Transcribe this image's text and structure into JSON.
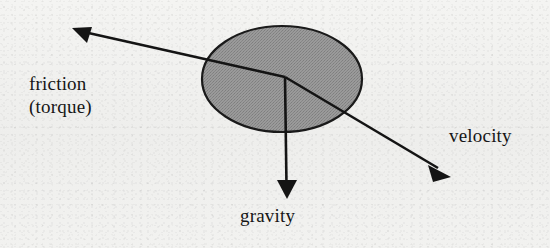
{
  "figure": {
    "width": 550,
    "height": 248,
    "background_color": "#f1f1ef"
  },
  "body": {
    "shape_name": "ellipse",
    "description": "gray filled ellipse representing a rolling wheel or ball",
    "center_x": 282,
    "center_y": 79,
    "radius_x": 80,
    "radius_y": 53,
    "fill_color": "#919191",
    "stroke_color": "#1a1a1a",
    "stroke_width": 2.2
  },
  "vectors": [
    {
      "id": "friction",
      "label_line1": "friction",
      "label_line2": "(torque)",
      "origin_x": 285,
      "origin_y": 77,
      "tip_x": 73,
      "tip_y": 29,
      "color": "#141414",
      "stroke_width": 2.6,
      "arrowhead": "solid-triangle"
    },
    {
      "id": "velocity",
      "label_line1": "velocity",
      "origin_x": 285,
      "origin_y": 77,
      "tip_x": 450,
      "tip_y": 176,
      "color": "#141414",
      "stroke_width": 2.6,
      "arrowhead": "solid-triangle"
    },
    {
      "id": "gravity",
      "label_line1": "gravity",
      "origin_x": 285,
      "origin_y": 77,
      "tip_x": 287,
      "tip_y": 199,
      "color": "#141414",
      "stroke_width": 2.6,
      "arrowhead": "solid-triangle"
    }
  ],
  "labels": {
    "friction_line1": "friction",
    "friction_line2": "(torque)",
    "velocity": "velocity",
    "gravity": "gravity"
  }
}
